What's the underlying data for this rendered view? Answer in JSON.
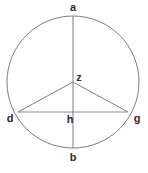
{
  "figure": {
    "name": "circle-with-inscribed-triangle",
    "background_color": "#ffffff",
    "width": 148,
    "height": 173
  },
  "style": {
    "stroke_color": "#7d7d7d",
    "chord_stroke_color": "#8a8a8a",
    "label_color": "#2b2b2b",
    "stroke_width": 1,
    "label_font_size": 11
  },
  "circle": {
    "center_x": 73,
    "center_y": 82,
    "radius": 66
  },
  "points": {
    "a": {
      "label": "a",
      "x": 73,
      "y": 16,
      "label_x": 73,
      "label_y": 8
    },
    "b": {
      "label": "b",
      "x": 73,
      "y": 148,
      "label_x": 73,
      "label_y": 158
    },
    "d": {
      "label": "d",
      "x": 18,
      "y": 112,
      "label_x": 10,
      "label_y": 119
    },
    "g": {
      "label": "g",
      "x": 128,
      "y": 112,
      "label_x": 137,
      "label_y": 119
    },
    "z": {
      "label": "z",
      "x": 73,
      "y": 82,
      "label_x": 79,
      "label_y": 78
    },
    "h": {
      "label": "h",
      "x": 73,
      "y": 112,
      "label_x": 70,
      "label_y": 120
    }
  },
  "segments": {
    "diameter_ab": {
      "name": "vertical-diameter-a-b",
      "from": "a",
      "to": "b"
    },
    "chord_dg": {
      "name": "horizontal-chord-d-g",
      "from": "d",
      "to": "g"
    },
    "radius_zd": {
      "name": "radius-z-d",
      "from": "z",
      "to": "d"
    },
    "radius_zg": {
      "name": "radius-z-g",
      "from": "z",
      "to": "g"
    }
  },
  "labels_order": [
    "a",
    "z",
    "d",
    "h",
    "g",
    "b"
  ]
}
